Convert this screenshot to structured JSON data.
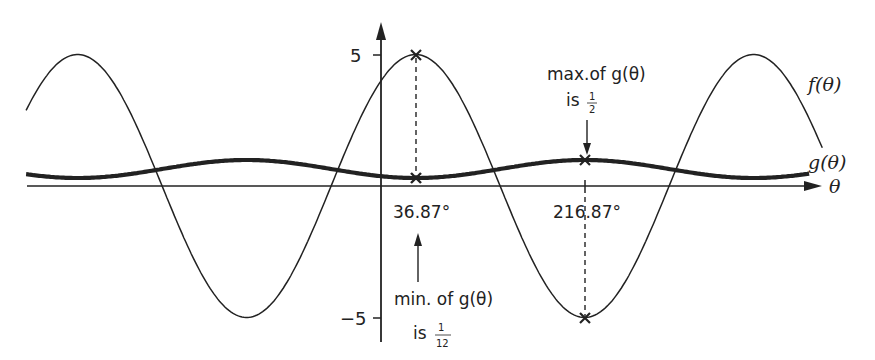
{
  "chart_data": {
    "type": "line",
    "title": "",
    "xlabel": "θ",
    "ylabel": "",
    "grid": false,
    "legend_position": "inline-right",
    "y_ticks": [
      {
        "value": 5,
        "label": "5"
      },
      {
        "value": -5,
        "label": "−5"
      }
    ],
    "x_marks": [
      {
        "value": 36.87,
        "label": "36.87°"
      },
      {
        "value": 216.87,
        "label": "216.87°"
      }
    ],
    "series": [
      {
        "name": "f(θ)",
        "label": "f(θ)",
        "formula": "5cos(θ − 36.87°)",
        "amplitude": 5,
        "phase_deg": 36.87,
        "x_range_deg": [
          -378,
          470
        ],
        "stroke": "thin",
        "points": [
          {
            "x": -323.13,
            "y": 5
          },
          {
            "x": -143.13,
            "y": -5
          },
          {
            "x": 36.87,
            "y": 5
          },
          {
            "x": 216.87,
            "y": -5
          },
          {
            "x": 396.87,
            "y": 5
          }
        ]
      },
      {
        "name": "g(θ)",
        "label": "g(θ)",
        "stroke": "thick",
        "min": {
          "x": 36.87,
          "y": 0.0833
        },
        "max": {
          "x": 216.87,
          "y": 0.5
        },
        "points": [
          {
            "x": -323.13,
            "y": 0.0833
          },
          {
            "x": -143.13,
            "y": 0.5
          },
          {
            "x": 36.87,
            "y": 0.0833
          },
          {
            "x": 216.87,
            "y": 0.5
          },
          {
            "x": 396.87,
            "y": 0.0833
          }
        ]
      }
    ],
    "annotations": [
      {
        "text_line1": "max.of g(θ)",
        "text_line2_prefix": "is",
        "frac_num": "1",
        "frac_den": "2",
        "at_x": 216.87
      },
      {
        "text_line1": "min. of g(θ)",
        "text_line2_prefix": "is",
        "frac_num": "1",
        "frac_den": "12",
        "at_x": 36.87
      }
    ]
  },
  "labels": {
    "y_pos": "5",
    "y_neg": "−5",
    "x_axis": "θ",
    "f_label": "f(θ)",
    "g_label": "g(θ)",
    "mark1": "36.87°",
    "mark2": "216.87°",
    "max_line1": "max.of g(θ)",
    "max_is": "is",
    "max_num": "1",
    "max_den": "2",
    "min_line1": "min. of g(θ)",
    "min_is": "is",
    "min_num": "1",
    "min_den": "12"
  },
  "colors": {
    "ink": "#222222",
    "background": "#ffffff"
  }
}
